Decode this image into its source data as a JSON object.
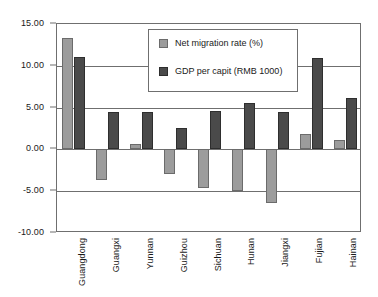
{
  "chart_data": {
    "type": "bar",
    "title": "",
    "subtitle": "",
    "xlabel": "",
    "ylabel": "",
    "ylim": [
      -10.0,
      15.0
    ],
    "ytick_values": [
      15.0,
      10.0,
      5.0,
      0.0,
      -5.0,
      -10.0
    ],
    "ytick_labels": [
      "15.00",
      "10.00",
      "5.00",
      "0.00",
      "-5.00",
      "-10.00"
    ],
    "grid": true,
    "grid_axis": "y",
    "legend_position": "top-center-inside",
    "categories": [
      "Guangdong",
      "Guangxi",
      "Yunnan",
      "Guizhou",
      "Sichuan",
      "Hunan",
      "Jiangxi",
      "Fujian",
      "Hainan"
    ],
    "series": [
      {
        "name": "Net migration rate (%)",
        "color": "#9c9c9c",
        "values": [
          13.3,
          -3.7,
          0.7,
          -3.0,
          -4.6,
          -5.0,
          -6.4,
          1.9,
          1.1
        ]
      },
      {
        "name": "GDP per capit (RMB 1000)",
        "color": "#4a4a4a",
        "values": [
          11.1,
          4.5,
          4.5,
          2.6,
          4.6,
          5.5,
          4.5,
          10.9,
          6.2
        ]
      }
    ],
    "annotations": []
  },
  "legend": {
    "items": [
      {
        "label": "Net migration rate (%)",
        "swatch": "legend-swatch-light"
      },
      {
        "label": "GDP per capit (RMB 1000)",
        "swatch": "legend-swatch-dark"
      }
    ]
  },
  "colors": {
    "series_light": "#9c9c9c",
    "series_dark": "#4a4a4a",
    "axis": "#6f6f6f",
    "background": "#ffffff",
    "text": "#1a1a1a"
  }
}
